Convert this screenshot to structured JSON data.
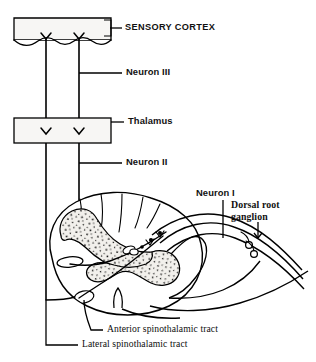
{
  "figure": {
    "background_color": "#ffffff",
    "ink_color": "#000000",
    "gray_matter_fill": "#f0eeea"
  },
  "labels": {
    "sensory_cortex": "SENSORY CORTEX",
    "neuron_iii": "Neuron III",
    "thalamus": "Thalamus",
    "neuron_ii": "Neuron II",
    "neuron_i": "Neuron I",
    "dorsal_root_line1": "Dorsal root",
    "dorsal_root_line2": "ganglion",
    "anterior_tract": "Anterior spinothalamic tract",
    "lateral_tract": "Lateral spinothalamic tract"
  },
  "structures": {
    "cortex_box": "sensory-cortex-box",
    "thalamus_box": "thalamus-box",
    "spinal_cord": "spinal-cord-cross-section",
    "gray_matter": "gray-matter-butterfly",
    "dorsal_root": "dorsal-root-with-ganglion",
    "ascending_tracts": "ascending-tract-lines"
  }
}
